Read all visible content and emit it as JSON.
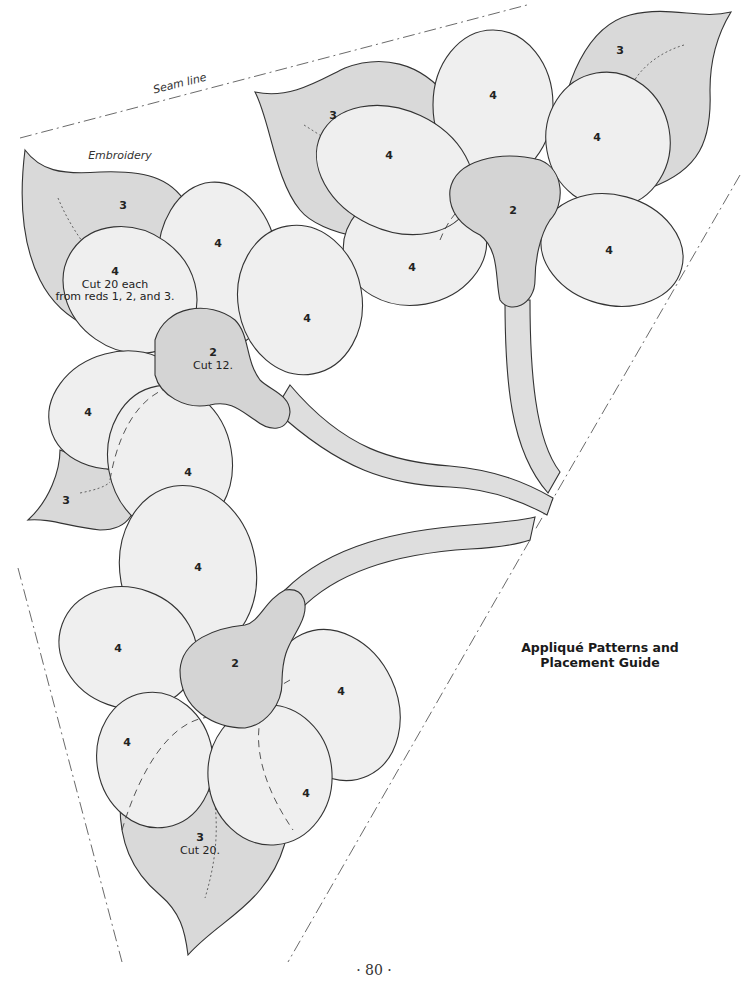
{
  "page": {
    "title_line1": "Appliqué Patterns and",
    "title_line2": "Placement Guide",
    "page_number": "· 80 ·"
  },
  "annotations": {
    "seam_line": "Seam line",
    "embroidery": "Embroidery"
  },
  "piece_labels": {
    "leaf": "3",
    "petal": "4",
    "center": "2"
  },
  "notes": {
    "petal_cut_line1": "Cut 20 each",
    "petal_cut_line2": "from reds 1, 2, and 3.",
    "center_cut": "Cut 12.",
    "leaf_cut": "Cut 20."
  },
  "colors": {
    "leaf_fill": "#d9d9d9",
    "petal_fill": "#efefef",
    "center_fill": "#d6d6d6",
    "stem_fill": "#dedede",
    "outline": "#333333",
    "seam": "#444444"
  }
}
